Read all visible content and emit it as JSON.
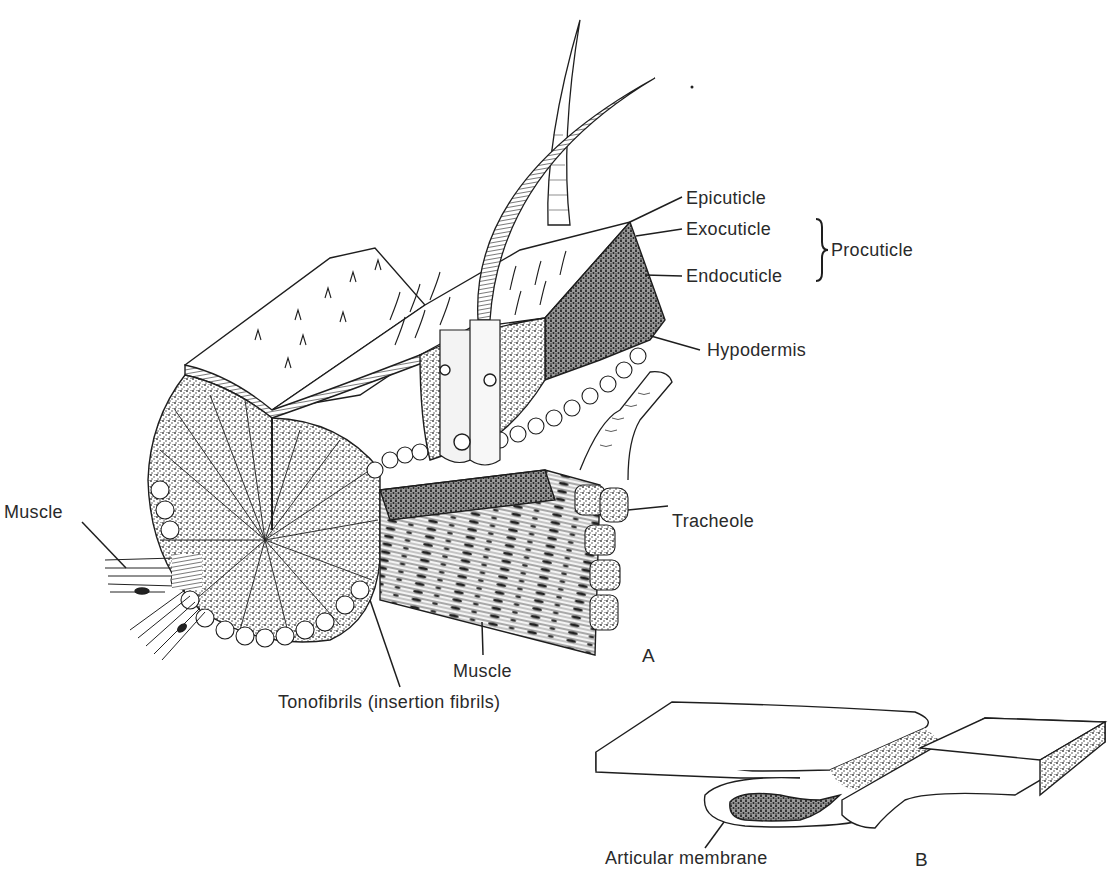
{
  "figure": {
    "panel_a": {
      "letter": "A",
      "labels": {
        "epicuticle": "Epicuticle",
        "exocuticle": "Exocuticle",
        "endocuticle": "Endocuticle",
        "procuticle": "Procuticle",
        "hypodermis": "Hypodermis",
        "tracheole": "Tracheole",
        "muscle_left": "Muscle",
        "muscle_bottom": "Muscle",
        "tonofibrils": "Tonofibrils (insertion fibrils)"
      }
    },
    "panel_b": {
      "letter": "B",
      "labels": {
        "articular_membrane": "Articular membrane"
      }
    },
    "colors": {
      "ink": "#1e1e1e",
      "stipple": "#555555",
      "background": "#ffffff"
    }
  }
}
